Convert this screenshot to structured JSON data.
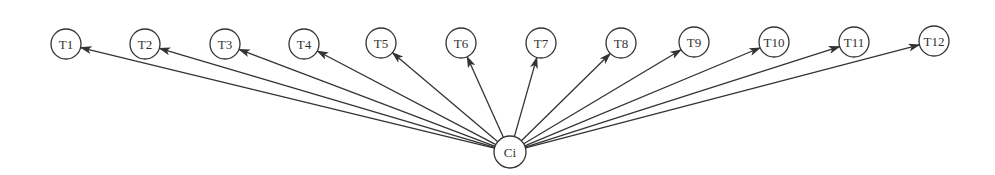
{
  "diagram": {
    "source": {
      "id": "Ci",
      "label": "Ci",
      "cx": 510,
      "cy": 152,
      "r": 16
    },
    "targets": [
      {
        "id": "T1",
        "label": "T1",
        "cx": 66,
        "cy": 44
      },
      {
        "id": "T2",
        "label": "T2",
        "cx": 145,
        "cy": 44
      },
      {
        "id": "T3",
        "label": "T3",
        "cx": 225,
        "cy": 44
      },
      {
        "id": "T4",
        "label": "T4",
        "cx": 304,
        "cy": 44
      },
      {
        "id": "T5",
        "label": "T5",
        "cx": 381,
        "cy": 43
      },
      {
        "id": "T6",
        "label": "T6",
        "cx": 461,
        "cy": 43
      },
      {
        "id": "T7",
        "label": "T7",
        "cx": 541,
        "cy": 43
      },
      {
        "id": "T8",
        "label": "T8",
        "cx": 621,
        "cy": 43
      },
      {
        "id": "T9",
        "label": "T9",
        "cx": 694,
        "cy": 42
      },
      {
        "id": "T10",
        "label": "T10",
        "cx": 774,
        "cy": 42
      },
      {
        "id": "T11",
        "label": "T11",
        "cx": 854,
        "cy": 42
      },
      {
        "id": "T12",
        "label": "T12",
        "cx": 934,
        "cy": 41
      }
    ],
    "target_radius": 15,
    "edge_direction": "source-to-targets",
    "stroke_color": "#333333"
  }
}
